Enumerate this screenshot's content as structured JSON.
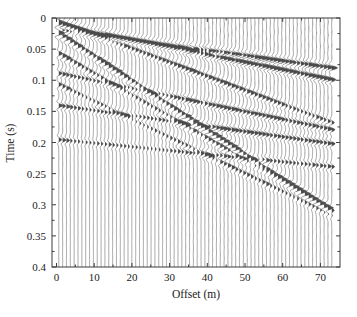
{
  "figure": {
    "background": "#ffffff",
    "width": 357,
    "height": 317,
    "plot_area": {
      "left": 52,
      "top": 18,
      "right": 340,
      "bottom": 267
    }
  },
  "chart_data": {
    "type": "line",
    "plot_style": "seismic-wiggle-variable-area",
    "title": "",
    "subtitle": "",
    "xlabel": "Offset (m)",
    "ylabel": "Time (s)",
    "xlim": [
      -1.2,
      75.2
    ],
    "ylim": [
      0.4,
      0.0
    ],
    "y_inverted": true,
    "grid": false,
    "legend": null,
    "legend_position": "none",
    "xticks": [
      0,
      10,
      20,
      30,
      40,
      50,
      60,
      70
    ],
    "xticklabels": [
      "0",
      "10",
      "20",
      "30",
      "40",
      "50",
      "60",
      "70"
    ],
    "yticks": [
      0,
      0.05,
      0.1,
      0.15,
      0.2,
      0.25,
      0.3,
      0.35,
      0.4
    ],
    "yticklabels": [
      "0",
      "0.05",
      "0.1",
      "0.15",
      "0.2",
      "0.25",
      "0.3",
      "0.35",
      "0.4"
    ],
    "x_minor_ticks": [
      5,
      15,
      25,
      35,
      45,
      55,
      65
    ],
    "y_minor_ticks": [
      0.025,
      0.075,
      0.125,
      0.175,
      0.225,
      0.275,
      0.325,
      0.375
    ],
    "trace_count": 72,
    "trace_offset_start": 0.6,
    "trace_offset_step": 1.02,
    "trace_colors": {
      "wiggle_line": "#5a5a5a",
      "positive_fill": "#4a4a4a"
    },
    "wavelet": {
      "type": "ricker",
      "dominant_frequency_hz": 62,
      "length_s": 0.048
    },
    "trace_amplitude_m": 1.55,
    "sample_interval_s": 0.0005,
    "events": [
      {
        "name": "direct-wave",
        "t0": 0.004,
        "slowness_s_per_m": 0.00225,
        "amplitude": 1.0,
        "decay": 0.016,
        "polarity": 1
      },
      {
        "name": "refraction-1",
        "t0": 0.01,
        "slowness_s_per_m": 0.00122,
        "amplitude": 0.92,
        "decay": 0.006,
        "polarity": 1
      },
      {
        "name": "refraction-2",
        "t0": 0.018,
        "slowness_s_per_m": 0.00085,
        "amplitude": 0.8,
        "decay": 0.004,
        "polarity": 1
      },
      {
        "name": "ground-roll-1",
        "t0": 0.022,
        "slowness_s_per_m": 0.00395,
        "amplitude": 1.05,
        "decay": 0.01,
        "polarity": 1
      },
      {
        "name": "ground-roll-2",
        "t0": 0.055,
        "slowness_s_per_m": 0.00345,
        "amplitude": 0.7,
        "decay": 0.012,
        "polarity": 1
      },
      {
        "name": "reflection-1",
        "t0": 0.088,
        "slowness_s_per_m": 0.00125,
        "amplitude": 0.6,
        "decay": 0.004,
        "polarity": 1
      },
      {
        "name": "reflection-2",
        "t0": 0.14,
        "slowness_s_per_m": 0.00085,
        "amplitude": 0.55,
        "decay": 0.003,
        "polarity": 1
      },
      {
        "name": "reflection-3",
        "t0": 0.195,
        "slowness_s_per_m": 0.0006,
        "amplitude": 0.42,
        "decay": 0.003,
        "polarity": 1
      },
      {
        "name": "noise-train",
        "t0": 0.105,
        "slowness_s_per_m": 0.0029,
        "amplitude": 0.5,
        "decay": 0.009,
        "polarity": 1
      }
    ]
  }
}
